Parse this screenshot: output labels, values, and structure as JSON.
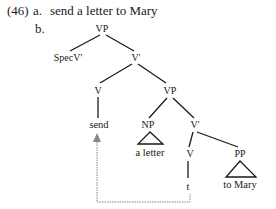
{
  "example": {
    "number": "(46)",
    "part_a_label": "a.",
    "part_a_text": "send a letter to Mary",
    "part_b_label": "b."
  },
  "tree": {
    "root": "VP",
    "spec": "SpecV'",
    "vbar1": "V'",
    "v1": "V",
    "vp2": "VP",
    "send": "send",
    "np": "NP",
    "vbar2": "V'",
    "np_leaf": "a letter",
    "v2": "V",
    "pp": "PP",
    "trace": "t",
    "pp_leaf": "to Mary"
  },
  "movement": {
    "from": "t",
    "to": "send",
    "style": "dotted",
    "color": "#888888"
  }
}
